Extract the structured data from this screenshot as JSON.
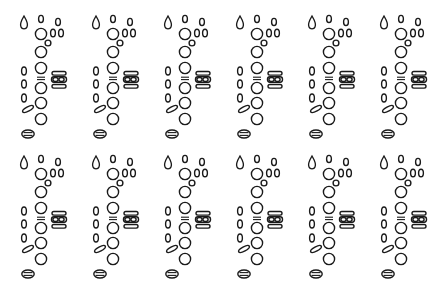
{
  "figure": {
    "type": "woodwind-fingering-chart-grid",
    "rows": 2,
    "columns": 6,
    "line_color": "#1a1a1a",
    "fill_open": "#ffffff",
    "fill_closed": "#1a1a1a"
  },
  "key_names": [
    "thumb-hole-key",
    "register-teardrop-key",
    "top-small-key",
    "top-right-small-key",
    "left-hand-ring-1",
    "side-small-key-a",
    "side-small-key-b",
    "trill-small-circle",
    "left-hand-ring-2",
    "left-hand-ring-3",
    "hand-separator",
    "right-hand-ring-1",
    "right-hand-ring-2",
    "right-hand-ring-3",
    "left-pinky-key-1",
    "left-pinky-key-2",
    "left-pinky-key-3",
    "left-pinky-slant-key",
    "right-cluster-top-key",
    "right-cluster-mid-left-key",
    "right-cluster-mid-right-key",
    "right-cluster-bottom-key"
  ],
  "diagrams": [
    {
      "row": 1,
      "column": 1,
      "closed_keys": []
    },
    {
      "row": 1,
      "column": 2,
      "closed_keys": []
    },
    {
      "row": 1,
      "column": 3,
      "closed_keys": []
    },
    {
      "row": 1,
      "column": 4,
      "closed_keys": []
    },
    {
      "row": 1,
      "column": 5,
      "closed_keys": []
    },
    {
      "row": 1,
      "column": 6,
      "closed_keys": []
    },
    {
      "row": 2,
      "column": 1,
      "closed_keys": []
    },
    {
      "row": 2,
      "column": 2,
      "closed_keys": []
    },
    {
      "row": 2,
      "column": 3,
      "closed_keys": []
    },
    {
      "row": 2,
      "column": 4,
      "closed_keys": []
    },
    {
      "row": 2,
      "column": 5,
      "closed_keys": []
    },
    {
      "row": 2,
      "column": 6,
      "closed_keys": []
    }
  ]
}
